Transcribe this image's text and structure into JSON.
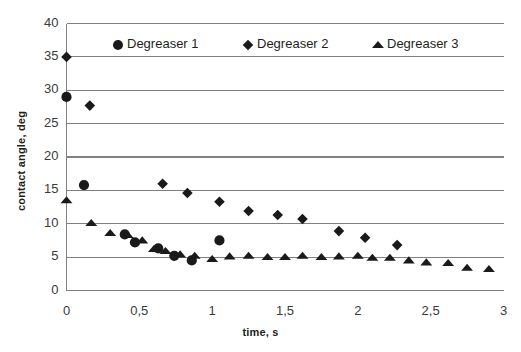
{
  "chart_data": {
    "type": "scatter",
    "title": "",
    "xlabel": "time, s",
    "ylabel": "contact angle, deg",
    "xlim": [
      0,
      3
    ],
    "ylim": [
      0,
      40
    ],
    "xticks": [
      "0",
      "0,5",
      "1",
      "1,5",
      "2",
      "2,5",
      "3"
    ],
    "xtick_values": [
      0,
      0.5,
      1,
      1.5,
      2,
      2.5,
      3
    ],
    "yticks": [
      "0",
      "5",
      "10",
      "15",
      "20",
      "25",
      "30",
      "35",
      "40"
    ],
    "ytick_values": [
      0,
      5,
      10,
      15,
      20,
      25,
      30,
      35,
      40
    ],
    "grid": "horizontal",
    "legend_position": "top-inside",
    "marker_color": "#1a1a1a",
    "axis_color": "#808080",
    "series": [
      {
        "name": "Degreaser 1",
        "marker": "circle",
        "points": [
          [
            0.0,
            29.0
          ],
          [
            0.12,
            15.8
          ],
          [
            0.4,
            8.4
          ],
          [
            0.47,
            7.2
          ],
          [
            0.63,
            6.3
          ],
          [
            0.74,
            5.2
          ],
          [
            0.86,
            4.5
          ],
          [
            1.05,
            7.5
          ]
        ]
      },
      {
        "name": "Degreaser 2",
        "marker": "diamond",
        "points": [
          [
            0.0,
            35.0
          ],
          [
            0.16,
            27.7
          ],
          [
            0.66,
            16.0
          ],
          [
            0.83,
            14.6
          ],
          [
            1.05,
            13.3
          ],
          [
            1.25,
            11.9
          ],
          [
            1.45,
            11.3
          ],
          [
            1.62,
            10.7
          ],
          [
            1.87,
            8.9
          ],
          [
            2.05,
            7.9
          ],
          [
            2.27,
            6.8
          ]
        ]
      },
      {
        "name": "Degreaser 3",
        "marker": "triangle",
        "points": [
          [
            0.0,
            13.5
          ],
          [
            0.17,
            10.1
          ],
          [
            0.3,
            8.6
          ],
          [
            0.42,
            8.3
          ],
          [
            0.52,
            7.5
          ],
          [
            0.6,
            6.2
          ],
          [
            0.68,
            5.9
          ],
          [
            0.78,
            5.4
          ],
          [
            0.88,
            5.2
          ],
          [
            1.0,
            4.7
          ],
          [
            1.12,
            5.1
          ],
          [
            1.25,
            5.2
          ],
          [
            1.38,
            5.0
          ],
          [
            1.5,
            5.0
          ],
          [
            1.62,
            5.2
          ],
          [
            1.75,
            5.0
          ],
          [
            1.87,
            5.1
          ],
          [
            2.0,
            5.2
          ],
          [
            2.1,
            4.9
          ],
          [
            2.22,
            4.9
          ],
          [
            2.35,
            4.5
          ],
          [
            2.47,
            4.2
          ],
          [
            2.62,
            4.1
          ],
          [
            2.75,
            3.4
          ],
          [
            2.9,
            3.2
          ]
        ]
      }
    ]
  },
  "legend": {
    "items": [
      {
        "label": "Degreaser 1",
        "marker": "circle"
      },
      {
        "label": "Degreaser 2",
        "marker": "diamond"
      },
      {
        "label": "Degreaser 3",
        "marker": "triangle"
      }
    ]
  }
}
